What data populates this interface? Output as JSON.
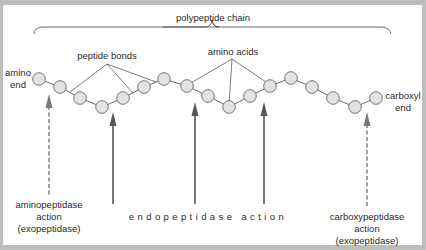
{
  "title": "polypeptide chain",
  "labels": {
    "peptide_bonds": "peptide bonds",
    "amino_acids": "amino acids",
    "amino_end_line1": "amino",
    "amino_end_line2": "end",
    "carboxyl_end_line1": "carboxyl",
    "carboxyl_end_line2": "end",
    "aminopeptidase_line1": "aminopeptidase",
    "aminopeptidase_line2": "action",
    "aminopeptidase_line3": "(exopeptidase)",
    "endopeptidase": "endopeptidase action",
    "carboxypeptidase_line1": "carboxypeptidase",
    "carboxypeptidase_line2": "action",
    "carboxypeptidase_line3": "(exopeptidase)"
  },
  "colors": {
    "frame": "#bdbdbd",
    "bead_fill": "#e3e3e3",
    "bead_stroke": "#555555",
    "line": "#444444",
    "solid_arrow": "#555555",
    "dashed_arrow": "#777777"
  },
  "beads": [
    [
      39,
      79
    ],
    [
      60,
      87
    ],
    [
      80,
      98
    ],
    [
      102,
      107
    ],
    [
      123,
      98
    ],
    [
      144,
      87
    ],
    [
      164,
      79
    ],
    [
      187,
      86
    ],
    [
      208,
      96
    ],
    [
      229,
      107
    ],
    [
      250,
      96
    ],
    [
      270,
      86
    ],
    [
      291,
      78
    ],
    [
      312,
      87
    ],
    [
      333,
      98
    ],
    [
      355,
      107
    ],
    [
      376,
      98
    ]
  ],
  "arrows": [
    {
      "type": "dashed",
      "x": 49,
      "tip_y": 94,
      "bottom_y": 195,
      "label": "aminopeptidase"
    },
    {
      "type": "solid",
      "x": 113,
      "tip_y": 112,
      "bottom_y": 204,
      "label": "endopeptidase"
    },
    {
      "type": "solid",
      "x": 195,
      "tip_y": 102,
      "bottom_y": 204,
      "label": "endopeptidase"
    },
    {
      "type": "solid",
      "x": 264,
      "tip_y": 102,
      "bottom_y": 204,
      "label": "endopeptidase"
    },
    {
      "type": "dashed",
      "x": 367,
      "tip_y": 112,
      "bottom_y": 207,
      "label": "carboxypeptidase"
    }
  ]
}
